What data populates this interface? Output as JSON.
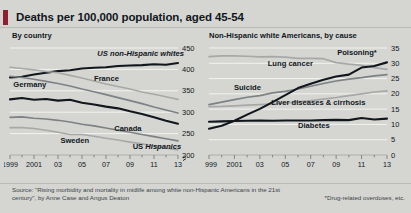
{
  "header": {
    "title": "Deaths per 100,000 population, aged 45-54",
    "accent_color": "#8c2230"
  },
  "footer": {
    "source": "Source: \"Rising morbidity and mortality in midlife among white non-Hispanic Americans in the 21st century\", by Anne Case and Angus Deaton",
    "footnote": "*Drug-related overdoses, etc."
  },
  "chart_data": [
    {
      "type": "line",
      "title": "By country",
      "xlabel": "",
      "ylabel": "",
      "x": [
        1999,
        2000,
        2001,
        2002,
        2003,
        2004,
        2005,
        2006,
        2007,
        2008,
        2009,
        2010,
        2011,
        2012,
        2013
      ],
      "xtick_labels": [
        "1999",
        "2001",
        "03",
        "05",
        "07",
        "09",
        "11",
        "13"
      ],
      "xtick_values": [
        1999,
        2001,
        2003,
        2005,
        2007,
        2009,
        2011,
        2013
      ],
      "ylim": [
        200,
        450
      ],
      "yticks": [
        200,
        250,
        300,
        350,
        400,
        450
      ],
      "axis_break": true,
      "grid": true,
      "legend": "inline-labels",
      "series": [
        {
          "name": "US non-Hispanic whites",
          "label_style": "bold-italic",
          "color": "#11171c",
          "width": 2.1,
          "values": [
            381,
            383,
            388,
            392,
            396,
            398,
            402,
            404,
            405,
            408,
            409,
            410,
            412,
            411,
            415
          ]
        },
        {
          "name": "France",
          "label_style": "bold",
          "color": "#a7a9a8",
          "width": 1.6,
          "values": [
            405,
            402,
            399,
            395,
            392,
            386,
            380,
            373,
            366,
            360,
            354,
            347,
            342,
            336,
            330
          ]
        },
        {
          "name": "Germany",
          "label_style": "bold",
          "color": "#7d8285",
          "width": 1.6,
          "values": [
            384,
            381,
            377,
            372,
            367,
            361,
            354,
            348,
            341,
            334,
            327,
            320,
            312,
            305,
            298
          ]
        },
        {
          "name": "Canada",
          "label_style": "bold",
          "color": "#11171c",
          "width": 2.1,
          "values": [
            330,
            333,
            329,
            331,
            327,
            329,
            322,
            318,
            313,
            309,
            302,
            296,
            288,
            280,
            273
          ]
        },
        {
          "name": "Sweden",
          "label_style": "bold",
          "color": "#7d8285",
          "width": 1.6,
          "values": [
            288,
            289,
            286,
            284,
            281,
            277,
            272,
            268,
            263,
            258,
            253,
            248,
            243,
            238,
            233
          ]
        },
        {
          "name": "US Hispanics",
          "label_style": "bold-mixed",
          "color": "#a7a9a8",
          "width": 1.6,
          "values": [
            264,
            264,
            262,
            258,
            253,
            248,
            248,
            244,
            239,
            235,
            230,
            226,
            221,
            216,
            212
          ]
        }
      ]
    },
    {
      "type": "line",
      "title": "Non-Hispanic white Americans, by cause",
      "xlabel": "",
      "ylabel": "",
      "x": [
        1999,
        2000,
        2001,
        2002,
        2003,
        2004,
        2005,
        2006,
        2007,
        2008,
        2009,
        2010,
        2011,
        2012,
        2013
      ],
      "xtick_labels": [
        "1999",
        "2001",
        "03",
        "05",
        "07",
        "09",
        "11",
        "13"
      ],
      "xtick_values": [
        1999,
        2001,
        2003,
        2005,
        2007,
        2009,
        2011,
        2013
      ],
      "ylim": [
        0,
        35
      ],
      "yticks": [
        0,
        5,
        10,
        15,
        20,
        25,
        30,
        35
      ],
      "grid": true,
      "legend": "inline-labels",
      "series": [
        {
          "name": "Lung cancer",
          "label_style": "bold",
          "color": "#a7a9a8",
          "width": 1.7,
          "values": [
            32.2,
            32.4,
            32.4,
            32.3,
            32.1,
            32.2,
            32.0,
            31.6,
            31.6,
            31.5,
            30.2,
            29.7,
            29.3,
            28.6,
            28.0
          ]
        },
        {
          "name": "Suicide",
          "label_style": "bold",
          "color": "#7d8285",
          "width": 1.7,
          "values": [
            16.5,
            17.3,
            18.1,
            18.9,
            19.4,
            20.3,
            20.8,
            21.6,
            22.5,
            23.4,
            24.2,
            24.8,
            25.3,
            25.9,
            26.3
          ]
        },
        {
          "name": "Liver diseases & cirrhosis",
          "label_style": "bold",
          "color": "#a7a9a8",
          "width": 1.7,
          "values": [
            15.8,
            15.9,
            16.1,
            16.3,
            16.5,
            16.7,
            17.0,
            17.4,
            17.8,
            18.3,
            18.8,
            19.4,
            20.0,
            20.6,
            21.0
          ]
        },
        {
          "name": "Poisoning*",
          "label_style": "bold",
          "color": "#11171c",
          "width": 2.1,
          "values": [
            8.6,
            9.6,
            11.2,
            13.2,
            15.1,
            17.3,
            19.6,
            21.9,
            23.3,
            24.6,
            25.7,
            26.3,
            28.6,
            29.1,
            30.3
          ]
        },
        {
          "name": "Diabetes",
          "label_style": "bold",
          "color": "#11171c",
          "width": 2.1,
          "values": [
            10.9,
            11.0,
            11.1,
            11.2,
            11.3,
            11.2,
            11.3,
            11.3,
            11.3,
            11.4,
            11.5,
            11.4,
            12.1,
            11.6,
            11.9
          ]
        }
      ]
    }
  ]
}
